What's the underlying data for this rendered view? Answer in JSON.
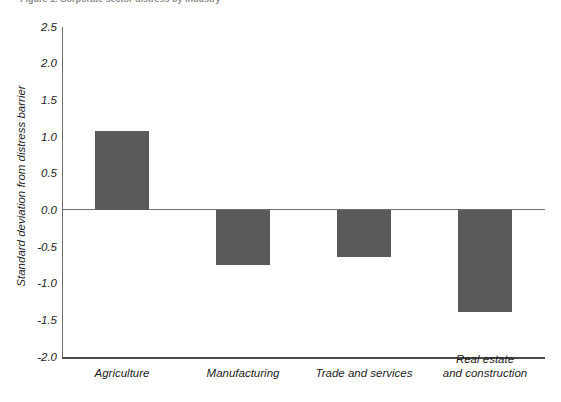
{
  "figure": {
    "caption_sliver": "Figure 1. Corporate sector distress by industry",
    "background": "#ffffff",
    "bar_color": "#5a5a5c",
    "axis_color": "#6e6e6e"
  },
  "chart_data": {
    "type": "bar",
    "title": "",
    "xlabel": "",
    "ylabel": "Standard deviation from distress barrier",
    "categories": [
      "Agriculture",
      "Manufacturing",
      "Trade and services",
      "Real estate\nand construction"
    ],
    "values": [
      1.08,
      -0.74,
      -0.63,
      -1.38
    ],
    "ylim": [
      -2.0,
      2.5
    ],
    "yticks": [
      2.5,
      2.0,
      1.5,
      1.0,
      0.5,
      0.0,
      -0.5,
      -1.0,
      -1.5,
      -2.0
    ],
    "ytick_labels": [
      "2.5",
      "2.0",
      "1.5",
      "1.0",
      "0.5",
      "0.0",
      "-0.5",
      "-1.0",
      "-1.5",
      "-2.0"
    ],
    "grid": false,
    "legend": null,
    "zero_line": 0.0
  }
}
